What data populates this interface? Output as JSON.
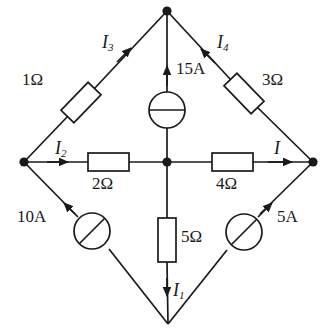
{
  "figure": {
    "kind": "circuit-diagram",
    "title": "",
    "width": 323,
    "height": 336,
    "background": "#ffffff",
    "line_color": "#1a1a1a",
    "text_color": "#1a1a1a"
  },
  "nodes": {
    "top": {
      "name": "top-node",
      "x": 167,
      "y": 11
    },
    "left": {
      "name": "left-node",
      "x": 24,
      "y": 162
    },
    "right": {
      "name": "right-node",
      "x": 313,
      "y": 162
    },
    "bottom": {
      "name": "bottom-node",
      "x": 168,
      "y": 324
    },
    "center": {
      "name": "center-node",
      "x": 167,
      "y": 162
    }
  },
  "components": {
    "r1": {
      "label": "1Ω",
      "type": "resistor",
      "orientation": "diagonal-up-right",
      "branch": "left-to-top"
    },
    "r3": {
      "label": "3Ω",
      "type": "resistor",
      "orientation": "diagonal-down-right",
      "branch": "top-to-right"
    },
    "r2": {
      "label": "2Ω",
      "type": "resistor",
      "orientation": "horizontal",
      "branch": "left-to-center"
    },
    "r4": {
      "label": "4Ω",
      "type": "resistor",
      "orientation": "horizontal",
      "branch": "center-to-right"
    },
    "r5": {
      "label": "5Ω",
      "type": "resistor",
      "orientation": "vertical",
      "branch": "center-to-bottom"
    },
    "src15": {
      "label": "15A",
      "type": "current-source",
      "symbol": "circle-horizontal-bar",
      "branch": "center-to-top"
    },
    "src10": {
      "label": "10A",
      "type": "current-source",
      "symbol": "circle-diagonal-bar",
      "branch": "bottom-to-left"
    },
    "src5": {
      "label": "5A",
      "type": "current-source",
      "symbol": "circle-diagonal-bar",
      "branch": "bottom-to-right"
    }
  },
  "currents": {
    "i1": {
      "symbol": "I",
      "subscript": "1",
      "direction": "down",
      "branch": "center-to-bottom"
    },
    "i2": {
      "symbol": "I",
      "subscript": "2",
      "direction": "right",
      "branch": "left-to-center"
    },
    "i3": {
      "symbol": "I",
      "subscript": "3",
      "direction": "up-right",
      "branch": "left-to-top"
    },
    "i4": {
      "symbol": "I",
      "subscript": "4",
      "direction": "up-left",
      "branch": "right-to-top"
    },
    "i": {
      "symbol": "I",
      "subscript": "",
      "direction": "right",
      "branch": "center-to-right"
    }
  }
}
